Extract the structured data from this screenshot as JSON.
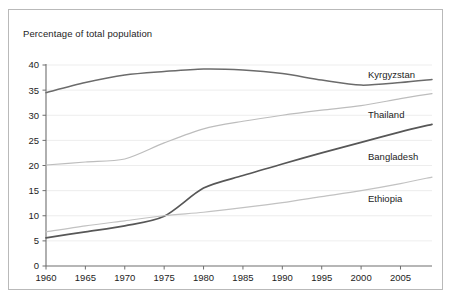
{
  "chart_data": {
    "type": "line",
    "title": "Percentage of total population",
    "xlabel": "",
    "ylabel": "",
    "xlim": [
      1960,
      2009
    ],
    "ylim": [
      0,
      40
    ],
    "grid": true,
    "legend_position": "inline-right",
    "x_ticks": [
      "1960",
      "1965",
      "1970",
      "1975",
      "1980",
      "1985",
      "1990",
      "1995",
      "2000",
      "2005"
    ],
    "x_tick_values": [
      1960,
      1965,
      1970,
      1975,
      1980,
      1985,
      1990,
      1995,
      2000,
      2005
    ],
    "y_ticks": [
      "0",
      "5",
      "10",
      "15",
      "20",
      "25",
      "30",
      "35",
      "40"
    ],
    "y_tick_values": [
      0,
      5,
      10,
      15,
      20,
      25,
      30,
      35,
      40
    ],
    "x": [
      1960,
      1965,
      1970,
      1975,
      1980,
      1985,
      1990,
      1995,
      2000,
      2005,
      2009
    ],
    "series": [
      {
        "name": "Kyrgyzstan",
        "color": "#6b6b6b",
        "width": 1.5,
        "values": [
          34.5,
          36.5,
          38.0,
          38.7,
          39.2,
          39.0,
          38.3,
          37.0,
          36.0,
          36.5,
          37.1
        ]
      },
      {
        "name": "Thailand",
        "color": "#bdbdbd",
        "width": 1.2,
        "values": [
          20.1,
          20.7,
          21.3,
          24.5,
          27.3,
          28.8,
          30.0,
          31.0,
          31.9,
          33.3,
          34.3
        ]
      },
      {
        "name": "Bangladesh",
        "color": "#575757",
        "width": 1.7,
        "values": [
          5.6,
          6.8,
          8.0,
          9.9,
          15.5,
          18.0,
          20.3,
          22.5,
          24.6,
          26.7,
          28.2
        ]
      },
      {
        "name": "Ethiopia",
        "color": "#c2c2c2",
        "width": 1.2,
        "values": [
          6.8,
          8.0,
          9.0,
          10.0,
          10.7,
          11.6,
          12.6,
          13.8,
          15.0,
          16.4,
          17.7
        ]
      }
    ]
  },
  "labels": {
    "kyrgyzstan": "Kyrgyzstan",
    "thailand": "Thailand",
    "bangladesh": "Bangladesh",
    "ethiopia": "Ethiopia"
  }
}
